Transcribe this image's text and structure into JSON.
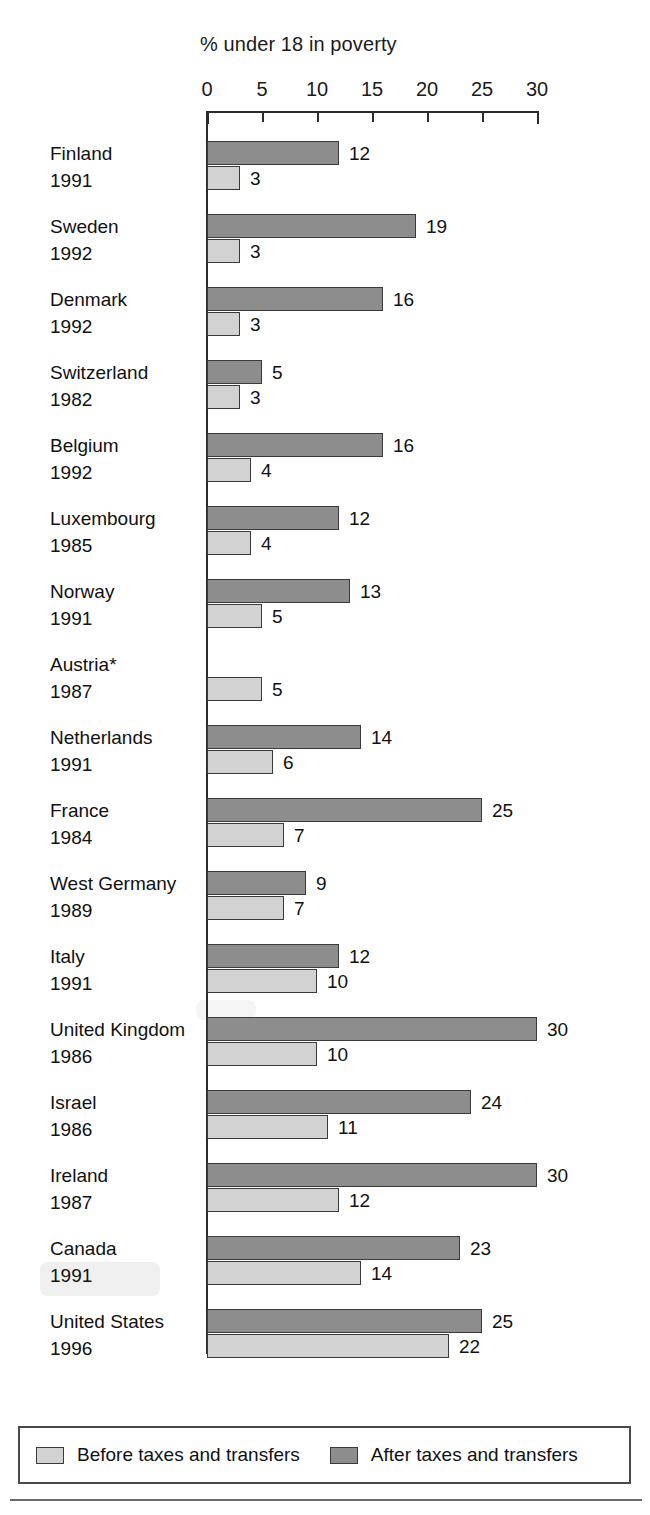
{
  "chart_data": {
    "type": "bar",
    "orientation": "horizontal",
    "title": "% under 18 in poverty",
    "xlabel": "",
    "ylabel": "",
    "xlim": [
      0,
      30
    ],
    "xticks": [
      0,
      5,
      10,
      15,
      20,
      25,
      30
    ],
    "grid": false,
    "legend_position": "bottom",
    "footnote_marker": "*",
    "series": [
      {
        "name": "Before taxes and transfers",
        "color": "#d2d2d2"
      },
      {
        "name": "After taxes and transfers",
        "color": "#8d8d8d"
      }
    ],
    "categories": [
      "Finland",
      "Sweden",
      "Denmark",
      "Switzerland",
      "Belgium",
      "Luxembourg",
      "Norway",
      "Austria*",
      "Netherlands",
      "France",
      "West Germany",
      "Italy",
      "United Kingdom",
      "Israel",
      "Ireland",
      "Canada",
      "United States"
    ],
    "years": [
      "1991",
      "1992",
      "1992",
      "1982",
      "1992",
      "1985",
      "1991",
      "1987",
      "1991",
      "1984",
      "1989",
      "1991",
      "1986",
      "1986",
      "1987",
      "1991",
      "1996"
    ],
    "rows": [
      {
        "country": "Finland",
        "year": "1991",
        "after": 12,
        "before": 3,
        "after_label": "12",
        "before_label": "3"
      },
      {
        "country": "Sweden",
        "year": "1992",
        "after": 19,
        "before": 3,
        "after_label": "19",
        "before_label": "3"
      },
      {
        "country": "Denmark",
        "year": "1992",
        "after": 16,
        "before": 3,
        "after_label": "16",
        "before_label": "3"
      },
      {
        "country": "Switzerland",
        "year": "1982",
        "after": 5,
        "before": 3,
        "after_label": "5",
        "before_label": "3"
      },
      {
        "country": "Belgium",
        "year": "1992",
        "after": 16,
        "before": 4,
        "after_label": "16",
        "before_label": "4"
      },
      {
        "country": "Luxembourg",
        "year": "1985",
        "after": 12,
        "before": 4,
        "after_label": "12",
        "before_label": "4"
      },
      {
        "country": "Norway",
        "year": "1991",
        "after": 13,
        "before": 5,
        "after_label": "13",
        "before_label": "5"
      },
      {
        "country": "Austria*",
        "year": "1987",
        "after": null,
        "before": 5,
        "after_label": "",
        "before_label": "5"
      },
      {
        "country": "Netherlands",
        "year": "1991",
        "after": 14,
        "before": 6,
        "after_label": "14",
        "before_label": "6"
      },
      {
        "country": "France",
        "year": "1984",
        "after": 25,
        "before": 7,
        "after_label": "25",
        "before_label": "7"
      },
      {
        "country": "West Germany",
        "year": "1989",
        "after": 9,
        "before": 7,
        "after_label": "9",
        "before_label": "7"
      },
      {
        "country": "Italy",
        "year": "1991",
        "after": 12,
        "before": 10,
        "after_label": "12",
        "before_label": "10"
      },
      {
        "country": "United Kingdom",
        "year": "1986",
        "after": 30,
        "before": 10,
        "after_label": "30",
        "before_label": "10"
      },
      {
        "country": "Israel",
        "year": "1986",
        "after": 24,
        "before": 11,
        "after_label": "24",
        "before_label": "11"
      },
      {
        "country": "Ireland",
        "year": "1987",
        "after": 30,
        "before": 12,
        "after_label": "30",
        "before_label": "12"
      },
      {
        "country": "Canada",
        "year": "1991",
        "after": 23,
        "before": 14,
        "after_label": "23",
        "before_label": "14"
      },
      {
        "country": "United States",
        "year": "1996",
        "after": 25,
        "before": 22,
        "after_label": "25",
        "before_label": "22"
      }
    ]
  },
  "axis": {
    "tick_labels": [
      "0",
      "5",
      "10",
      "15",
      "20",
      "25",
      "30"
    ]
  },
  "legend": {
    "items": [
      {
        "label": "Before taxes and transfers",
        "swatch": "before"
      },
      {
        "label": "After taxes and transfers",
        "swatch": "after"
      }
    ]
  },
  "colors": {
    "before_fill": "#d2d2d2",
    "after_fill": "#8d8d8d",
    "outline": "#3a3a3a",
    "axis": "#2b2b2b",
    "text": "#111111",
    "background": "#ffffff"
  }
}
